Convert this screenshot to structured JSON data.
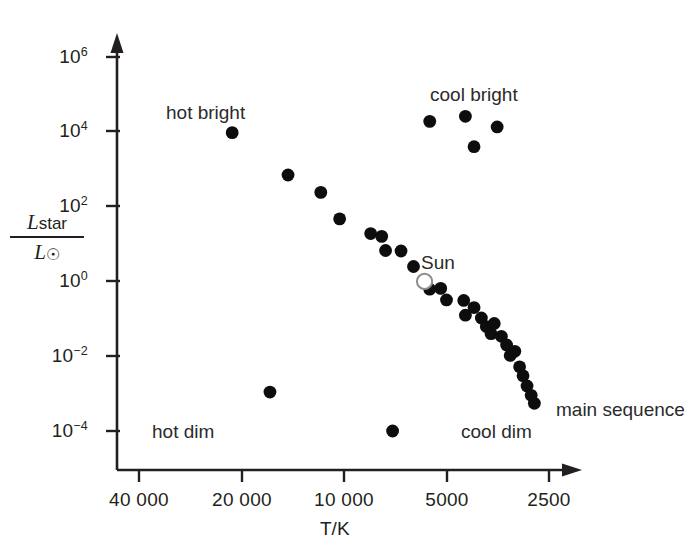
{
  "chart_data": {
    "type": "scatter",
    "title": "",
    "xlabel": "T/K",
    "ylabel_numerator": "L_star",
    "ylabel_denominator": "L_sun",
    "xscale": "log-reversed",
    "yscale": "log",
    "xticks": [
      "40 000",
      "20 000",
      "10 000",
      "5000",
      "2500"
    ],
    "xtick_values": [
      40000,
      20000,
      10000,
      5000,
      2500
    ],
    "yticks": [
      "10^6",
      "10^4",
      "10^2",
      "10^0",
      "10^-2",
      "10^-4"
    ],
    "ytick_values": [
      1000000,
      10000,
      100,
      1,
      0.01,
      0.0001
    ],
    "xlim": [
      40000,
      2400
    ],
    "ylim": [
      1e-05,
      4000000
    ],
    "grid": false,
    "legend": "none",
    "annotations": [
      {
        "text": "hot bright",
        "x": 21000,
        "y": 110000
      },
      {
        "text": "cool bright",
        "x": 4700,
        "y": 115000
      },
      {
        "text": "hot dim",
        "x": 26000,
        "y": 0.00011
      },
      {
        "text": "cool dim",
        "x": 4700,
        "y": 0.00011
      },
      {
        "text": "Sun",
        "x": 5400,
        "y": 9.0
      },
      {
        "text": "main sequence",
        "x": 2380,
        "y": 0.0011
      }
    ],
    "series": [
      {
        "name": "main sequence",
        "marker": "filled-circle",
        "color": "#0d0d0d",
        "points": [
          {
            "T": 21300,
            "L": 9500
          },
          {
            "T": 14600,
            "L": 700
          },
          {
            "T": 11700,
            "L": 240
          },
          {
            "T": 10300,
            "L": 47
          },
          {
            "T": 8350,
            "L": 19
          },
          {
            "T": 7750,
            "L": 16
          },
          {
            "T": 7550,
            "L": 6.7
          },
          {
            "T": 6800,
            "L": 6.5
          },
          {
            "T": 6250,
            "L": 2.5
          },
          {
            "T": 5800,
            "L": 1.0
          },
          {
            "T": 5600,
            "L": 0.62
          },
          {
            "T": 5200,
            "L": 0.65
          },
          {
            "T": 5000,
            "L": 0.32
          },
          {
            "T": 4450,
            "L": 0.31
          },
          {
            "T": 4150,
            "L": 0.2
          },
          {
            "T": 4400,
            "L": 0.125
          },
          {
            "T": 3950,
            "L": 0.105
          },
          {
            "T": 3820,
            "L": 0.062
          },
          {
            "T": 3620,
            "L": 0.075
          },
          {
            "T": 3700,
            "L": 0.04
          },
          {
            "T": 3450,
            "L": 0.034
          },
          {
            "T": 3330,
            "L": 0.02
          },
          {
            "T": 3250,
            "L": 0.0105
          },
          {
            "T": 3150,
            "L": 0.0135
          },
          {
            "T": 3050,
            "L": 0.0052
          },
          {
            "T": 2980,
            "L": 0.003
          },
          {
            "T": 2900,
            "L": 0.0016
          },
          {
            "T": 2820,
            "L": 0.0009
          },
          {
            "T": 2760,
            "L": 0.00055
          }
        ]
      },
      {
        "name": "cool bright (giants)",
        "marker": "filled-circle",
        "color": "#0d0d0d",
        "points": [
          {
            "T": 5600,
            "L": 19000
          },
          {
            "T": 4400,
            "L": 26000
          },
          {
            "T": 3550,
            "L": 13500
          },
          {
            "T": 4150,
            "L": 4000
          }
        ]
      },
      {
        "name": "hot dim (white dwarfs)",
        "marker": "filled-circle",
        "color": "#0d0d0d",
        "points": [
          {
            "T": 16500,
            "L": 0.0011
          },
          {
            "T": 7200,
            "L": 0.0001
          }
        ]
      },
      {
        "name": "Sun",
        "marker": "open-circle",
        "color": "#8c8c8c",
        "points": [
          {
            "T": 5800,
            "L": 1.0
          }
        ]
      }
    ]
  },
  "axes": {
    "y_ticks_text": [
      "10",
      "10",
      "10",
      "10",
      "10",
      "10"
    ],
    "y_exponents": [
      "6",
      "4",
      "2",
      "0",
      "−2",
      "−4"
    ],
    "x_ticks_text": [
      "40 000",
      "20 000",
      "10 000",
      "5000",
      "2500"
    ],
    "x_title": "T/K",
    "y_numerator_base": "L",
    "y_numerator_sub": "star",
    "y_denominator_base": "L",
    "y_denominator_sub": "⊙"
  },
  "labels": {
    "hot_bright": "hot bright",
    "cool_bright": "cool bright",
    "hot_dim": "hot dim",
    "cool_dim": "cool dim",
    "sun": "Sun",
    "main_sequence": "main sequence"
  },
  "colors": {
    "axis": "#231f20",
    "marker": "#0d0d0d",
    "sun_stroke": "#8c8c8c",
    "background": "#ffffff",
    "text": "#231f20"
  }
}
